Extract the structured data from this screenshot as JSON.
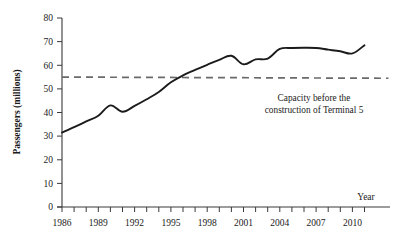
{
  "chart_data": {
    "type": "line",
    "title": "",
    "xlabel": "Year",
    "ylabel": "Passengers (millions)",
    "xlim": [
      1986,
      2011
    ],
    "ylim": [
      0,
      80
    ],
    "grid": false,
    "legend": "none",
    "x": [
      1986,
      1987,
      1988,
      1989,
      1990,
      1991,
      1992,
      1993,
      1994,
      1995,
      1996,
      1997,
      1998,
      1999,
      2000,
      2001,
      2002,
      2003,
      2004,
      2005,
      2006,
      2007,
      2008,
      2009,
      2010,
      2011
    ],
    "series": [
      {
        "name": "Passengers",
        "values": [
          31.5,
          33.8,
          36.2,
          38.6,
          43.0,
          40.3,
          42.8,
          45.6,
          48.7,
          52.8,
          55.7,
          58.0,
          60.2,
          62.3,
          64.0,
          60.4,
          62.5,
          62.8,
          66.9,
          67.3,
          67.4,
          67.3,
          66.6,
          65.9,
          65.0,
          68.5
        ]
      }
    ],
    "reference_line": {
      "name": "capacity-before-terminal-5",
      "value": 55,
      "style": "dashed",
      "color": "#6a6a6a"
    },
    "annotations": [
      {
        "name": "capacity-annotation",
        "line1": "Capacity  before the",
        "line2": "construction of Terminal 5"
      }
    ],
    "ytick_labels": [
      "0",
      "10",
      "20",
      "30",
      "40",
      "50",
      "60",
      "70",
      "80"
    ],
    "ytick_values": [
      0,
      10,
      20,
      30,
      40,
      50,
      60,
      70,
      80
    ],
    "xtick_labels": [
      "1986",
      "1989",
      "1992",
      "1995",
      "1998",
      "2001",
      "2004",
      "2007",
      "2010"
    ],
    "xtick_values": [
      1986,
      1989,
      1992,
      1995,
      1998,
      2001,
      2004,
      2007,
      2010
    ],
    "xtick_minor_every": 1
  }
}
